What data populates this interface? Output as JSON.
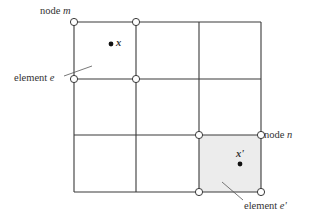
{
  "diagram": {
    "type": "finite-element-mesh",
    "grid": {
      "rows": 3,
      "cols": 3,
      "x_lines": [
        74,
        136,
        199,
        261
      ],
      "y_lines": [
        22,
        79,
        135,
        192
      ]
    },
    "colors": {
      "line": "#3a3a3a",
      "shade": "#ececec",
      "node_fill": "#ffffff"
    },
    "labels": {
      "node_m": {
        "prefix": "node ",
        "var": "m"
      },
      "node_n": {
        "prefix": "node ",
        "var": "n"
      },
      "element_e": {
        "prefix": "element ",
        "var": "e"
      },
      "element_e_prime": {
        "prefix": "element ",
        "var": "e'"
      },
      "point_x": "x",
      "point_x_prime": "x'"
    },
    "highlighted_nodes": [
      [
        74,
        22
      ],
      [
        136,
        22
      ],
      [
        74,
        79
      ],
      [
        136,
        79
      ],
      [
        199,
        135
      ],
      [
        261,
        135
      ],
      [
        199,
        192
      ],
      [
        261,
        192
      ]
    ]
  }
}
